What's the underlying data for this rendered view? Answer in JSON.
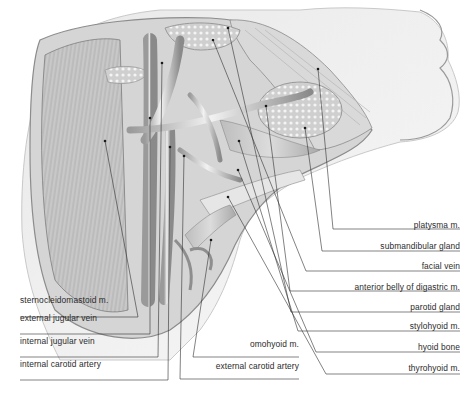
{
  "figure": {
    "labels_right": [
      {
        "id": "platysma",
        "text": "platysma m.",
        "x": 460,
        "y": 231
      },
      {
        "id": "submandibular-gland",
        "text": "submandibular gland",
        "x": 460,
        "y": 252
      },
      {
        "id": "facial-vein",
        "text": "facial vein",
        "x": 460,
        "y": 272
      },
      {
        "id": "anterior-belly-digastric",
        "text": "anterior belly of digastric m.",
        "x": 460,
        "y": 293
      },
      {
        "id": "parotid-gland",
        "text": "parotid gland",
        "x": 460,
        "y": 313
      },
      {
        "id": "stylohyoid",
        "text": "stylohyoid m.",
        "x": 460,
        "y": 332
      },
      {
        "id": "hyoid-bone",
        "text": "hyoid bone",
        "x": 460,
        "y": 353
      },
      {
        "id": "thyrohyoid",
        "text": "thyrohyoid m.",
        "x": 460,
        "y": 374
      }
    ],
    "labels_left": [
      {
        "id": "sternocleidomastoid",
        "text": "sternocleidomastoid m.",
        "x": 20,
        "y": 306
      },
      {
        "id": "external-jugular-vein",
        "text": "external jugular vein",
        "x": 20,
        "y": 324
      },
      {
        "id": "internal-jugular-vein",
        "text": "internal jugular vein",
        "x": 20,
        "y": 347
      },
      {
        "id": "internal-carotid-artery",
        "text": "internal carotid artery",
        "x": 20,
        "y": 370
      }
    ],
    "labels_bottom": [
      {
        "id": "omohyoid",
        "text": "omohyoid m.",
        "x": 299,
        "y": 350
      },
      {
        "id": "external-carotid-artery",
        "text": "external carotid artery",
        "x": 299,
        "y": 372
      }
    ],
    "leaders": [
      {
        "id": "platysma",
        "pts": [
          [
            318,
            69
          ],
          [
            333,
            229
          ],
          [
            460,
            229
          ]
        ]
      },
      {
        "id": "submandibular-gland",
        "pts": [
          [
            305,
            128
          ],
          [
            322,
            251
          ],
          [
            460,
            251
          ]
        ]
      },
      {
        "id": "facial-vein",
        "pts": [
          [
            213,
            40
          ],
          [
            306,
            271
          ],
          [
            460,
            271
          ]
        ]
      },
      {
        "id": "anterior-belly-digastric",
        "pts": [
          [
            266,
            106
          ],
          [
            290,
            291
          ],
          [
            460,
            291
          ]
        ]
      },
      {
        "id": "parotid-gland",
        "pts": [
          [
            228,
            28
          ],
          [
            291,
            312
          ],
          [
            460,
            312
          ]
        ]
      },
      {
        "id": "stylohyoid",
        "pts": [
          [
            239,
            141
          ],
          [
            298,
            331
          ],
          [
            460,
            331
          ]
        ]
      },
      {
        "id": "hyoid-bone",
        "pts": [
          [
            238,
            170
          ],
          [
            316,
            352
          ],
          [
            460,
            352
          ]
        ]
      },
      {
        "id": "thyrohyoid",
        "pts": [
          [
            228,
            197
          ],
          [
            326,
            374
          ],
          [
            460,
            374
          ]
        ]
      },
      {
        "id": "sternocleidomastoid",
        "pts": [
          [
            105,
            141
          ],
          [
            138,
            317
          ],
          [
            20,
            317
          ]
        ]
      },
      {
        "id": "external-jugular-vein",
        "pts": [
          [
            150,
            118
          ],
          [
            150,
            334
          ],
          [
            20,
            334
          ]
        ]
      },
      {
        "id": "internal-jugular-vein",
        "pts": [
          [
            162,
            63
          ],
          [
            158,
            357
          ],
          [
            20,
            357
          ]
        ]
      },
      {
        "id": "internal-carotid-artery",
        "pts": [
          [
            170,
            147
          ],
          [
            168,
            380
          ],
          [
            20,
            380
          ]
        ]
      },
      {
        "id": "omohyoid",
        "pts": [
          [
            211,
            240
          ],
          [
            193,
            357
          ],
          [
            299,
            357
          ]
        ]
      },
      {
        "id": "external-carotid-artery",
        "pts": [
          [
            184,
            156
          ],
          [
            180,
            379
          ],
          [
            299,
            379
          ]
        ]
      }
    ]
  }
}
